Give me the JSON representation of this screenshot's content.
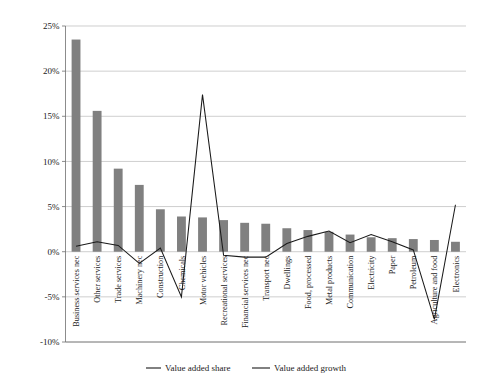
{
  "chart_data": {
    "type": "bar",
    "title": "",
    "subtitle": "",
    "xlabel": "",
    "ylabel": "",
    "ylim": [
      -10,
      25
    ],
    "ytick_values": [
      25,
      20,
      15,
      10,
      5,
      0,
      -5,
      -10
    ],
    "ytick_labels": [
      "25%",
      "20%",
      "15%",
      "10%",
      "5%",
      "0%",
      "-5%",
      "-10%"
    ],
    "grid": true,
    "legend_position": "bottom",
    "categories": [
      "Business services nec",
      "Other services",
      "Trade services",
      "Machinery nec",
      "Construction",
      "Chemicals",
      "Motor vehicles",
      "Recreational services",
      "Financial services nec",
      "Transport nec",
      "Dwellings",
      "Food, processed",
      "Metal products",
      "Communication",
      "Electricity",
      "Paper",
      "Petroleum",
      "Agriculture and food",
      "Electronics"
    ],
    "series": [
      {
        "name": "Value added share",
        "type": "bar",
        "color": "#808080",
        "values": [
          23.5,
          15.6,
          9.2,
          7.4,
          4.7,
          3.9,
          3.8,
          3.5,
          3.2,
          3.1,
          2.6,
          2.4,
          2.2,
          1.9,
          1.6,
          1.5,
          1.4,
          1.3,
          1.1
        ]
      },
      {
        "name": "Value added growth",
        "type": "line",
        "color": "#1a1a1a",
        "values": [
          0.6,
          1.1,
          0.7,
          -1.3,
          0.4,
          -5.0,
          17.4,
          -0.4,
          -0.6,
          -0.6,
          0.9,
          1.7,
          2.3,
          1.0,
          1.9,
          1.1,
          0.2,
          -7.5,
          5.2
        ]
      }
    ]
  },
  "legend": {
    "items": [
      {
        "label": "Value added share",
        "marker": "bar-swatch"
      },
      {
        "label": "Value added growth",
        "marker": "line-swatch"
      }
    ]
  }
}
